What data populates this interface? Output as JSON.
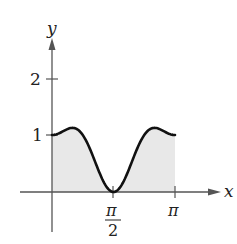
{
  "chart_data": {
    "type": "area",
    "title": "",
    "xlabel": "x",
    "ylabel": "y",
    "function_description": "smooth curve starting at (0,1), peaking slightly above 1, dipping to 0 at x=π/2, rising to a peak slightly above 1, and ending at (π,1); region beneath curve shaded",
    "x_ticks": [
      {
        "value": 1.5708,
        "label_num": "π",
        "label_den": "2"
      },
      {
        "value": 3.1416,
        "label": "π"
      }
    ],
    "y_ticks": [
      {
        "value": 1,
        "label": "1"
      },
      {
        "value": 2,
        "label": "2"
      }
    ],
    "xlim": [
      -0.4,
      3.9
    ],
    "ylim": [
      -0.9,
      2.7
    ],
    "points": [
      [
        0,
        1.0
      ],
      [
        0.2618,
        1.067
      ],
      [
        0.5236,
        1.125
      ],
      [
        0.7854,
        1.0
      ],
      [
        1.0472,
        0.625
      ],
      [
        1.309,
        0.2
      ],
      [
        1.5708,
        0.0
      ],
      [
        1.8326,
        0.2
      ],
      [
        2.0944,
        0.625
      ],
      [
        2.3562,
        1.0
      ],
      [
        2.618,
        1.125
      ],
      [
        2.8798,
        1.067
      ],
      [
        3.1416,
        1.0
      ]
    ],
    "shaded_region": {
      "from": 0,
      "to": 3.1416,
      "color": "#e6e6e6"
    },
    "curve_color": "#111111",
    "grid": false,
    "legend": null
  },
  "labels": {
    "y_axis": "y",
    "x_axis": "x",
    "tick_y2": "2",
    "tick_y1": "1",
    "tick_pi_half_num": "π",
    "tick_pi_half_den": "2",
    "tick_pi": "π"
  }
}
